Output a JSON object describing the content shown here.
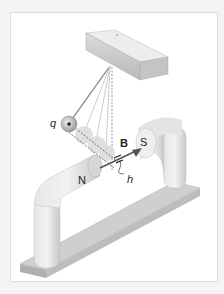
{
  "diagram": {
    "labels": {
      "charge": "q",
      "field": "B",
      "north": "N",
      "south": "S",
      "height": "h"
    },
    "colors": {
      "background": "#ffffff",
      "border": "#dcdcdc",
      "magnet": "#d8d8d8",
      "base": "#bdbdbd",
      "string": "#8a8a8a",
      "arrow": "#555555"
    }
  }
}
